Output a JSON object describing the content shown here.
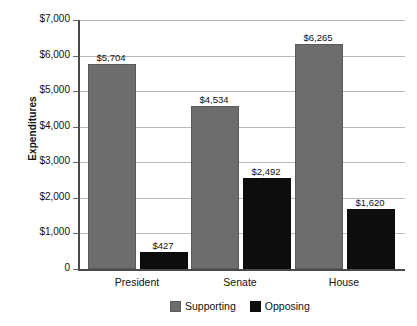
{
  "chart_data": {
    "type": "bar",
    "title": "",
    "xlabel": "",
    "ylabel": "Expenditures",
    "categories": [
      "President",
      "Senate",
      "House"
    ],
    "series": [
      {
        "name": "Supporting",
        "color": "#6d6d6d",
        "values": [
          5704,
          4534,
          6265
        ],
        "labels": [
          "$5,704",
          "$4,534",
          "$6,265"
        ]
      },
      {
        "name": "Opposing",
        "color": "#0d0d0d",
        "values": [
          427,
          2492,
          1620
        ],
        "labels": [
          "$427",
          "$2,492",
          "$1,620"
        ]
      }
    ],
    "ylim": [
      0,
      7000
    ],
    "yticks": [
      0,
      1000,
      2000,
      3000,
      4000,
      5000,
      6000,
      7000
    ],
    "ytick_labels": [
      "0",
      "$1,000",
      "$2,000",
      "$3,000",
      "$4,000",
      "$5,000",
      "$6,000",
      "$7,000"
    ],
    "grid": true,
    "legend_position": "bottom"
  }
}
